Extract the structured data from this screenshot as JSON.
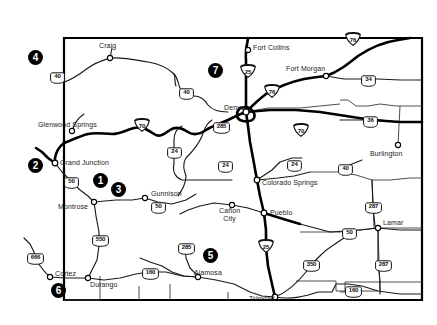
{
  "map": {
    "title": "Colorado highway map",
    "background_color": "#ffffff",
    "outline_color": "#000000",
    "state_border": {
      "corners": [
        [
          64,
          38
        ],
        [
          422,
          38
        ],
        [
          422,
          300
        ],
        [
          64,
          300
        ]
      ]
    }
  },
  "cities": [
    {
      "name": "Craig",
      "x": 108,
      "y": 47,
      "dot_x": 110,
      "dot_y": 58,
      "anchor": "center"
    },
    {
      "name": "Fort Collins",
      "x": 255,
      "y": 44,
      "dot_x": 248,
      "dot_y": 50,
      "anchor": "left"
    },
    {
      "name": "Fort Morgan",
      "x": 287,
      "y": 67,
      "dot_x": 326,
      "dot_y": 76,
      "anchor": "left"
    },
    {
      "name": "Denver",
      "x": 228,
      "y": 105,
      "dot_x": 246,
      "dot_y": 112,
      "anchor": "left"
    },
    {
      "name": "Glenwood Springs",
      "x": 39,
      "y": 122,
      "dot_x": 72,
      "dot_y": 131,
      "anchor": "left"
    },
    {
      "name": "Grand Junction",
      "x": 59,
      "y": 164,
      "dot_x": 55,
      "dot_y": 163,
      "anchor": "left"
    },
    {
      "name": "Burlington",
      "x": 371,
      "y": 152,
      "dot_x": 398,
      "dot_y": 145,
      "anchor": "left"
    },
    {
      "name": "Gunnison",
      "x": 133,
      "y": 190,
      "dot_x": 145,
      "dot_y": 198,
      "anchor": "left"
    },
    {
      "name": "Montrose",
      "x": 58,
      "y": 205,
      "dot_x": 94,
      "dot_y": 202,
      "anchor": "left"
    },
    {
      "name": "Colorado Springs",
      "x": 261,
      "y": 181,
      "dot_x": 257,
      "dot_y": 180,
      "anchor": "left"
    },
    {
      "name": "Pueblo",
      "x": 270,
      "y": 214,
      "dot_x": 264,
      "dot_y": 213,
      "anchor": "left"
    },
    {
      "name": "Lamar",
      "x": 383,
      "y": 221,
      "dot_x": 378,
      "dot_y": 228,
      "anchor": "left"
    },
    {
      "name": "Cortez",
      "x": 46,
      "y": 270,
      "dot_x": 50,
      "dot_y": 277,
      "anchor": "left"
    },
    {
      "name": "Durango",
      "x": 90,
      "y": 283,
      "dot_x": 88,
      "dot_y": 278,
      "anchor": "left"
    },
    {
      "name": "Alamosa",
      "x": 201,
      "y": 272,
      "dot_x": 198,
      "dot_y": 277,
      "anchor": "left"
    },
    {
      "name": "Trinidad",
      "x": 250,
      "y": 299,
      "dot_x": 275,
      "dot_y": 297,
      "anchor": "left"
    }
  ],
  "cities_multiline": [
    {
      "name_line1": "Cañon",
      "name_line2": "City",
      "x": 230,
      "y": 208,
      "dot_x": 232,
      "dot_y": 205
    }
  ],
  "shields": [
    {
      "route": "40",
      "type": "us",
      "x": 49,
      "y": 70
    },
    {
      "route": "40",
      "type": "us",
      "x": 178,
      "y": 86
    },
    {
      "route": "70",
      "type": "interstate",
      "x": 134,
      "y": 118
    },
    {
      "route": "285",
      "type": "us",
      "x": 212,
      "y": 120
    },
    {
      "route": "25",
      "type": "interstate",
      "x": 246,
      "y": 70
    },
    {
      "route": "76",
      "type": "interstate",
      "x": 268,
      "y": 90
    },
    {
      "route": "76",
      "type": "interstate",
      "x": 351,
      "y": 38
    },
    {
      "route": "34",
      "type": "us",
      "x": 366,
      "y": 79
    },
    {
      "route": "36",
      "type": "us",
      "x": 368,
      "y": 120
    },
    {
      "route": "70",
      "type": "interstate",
      "x": 299,
      "y": 129
    },
    {
      "route": "24",
      "type": "us",
      "x": 174,
      "y": 151
    },
    {
      "route": "24",
      "type": "us",
      "x": 225,
      "y": 165
    },
    {
      "route": "24",
      "type": "us",
      "x": 294,
      "y": 164
    },
    {
      "route": "40",
      "type": "us",
      "x": 344,
      "y": 168
    },
    {
      "route": "50",
      "type": "us",
      "x": 71,
      "y": 181
    },
    {
      "route": "50",
      "type": "us",
      "x": 158,
      "y": 206
    },
    {
      "route": "287",
      "type": "us",
      "x": 372,
      "y": 206
    },
    {
      "route": "50",
      "type": "us",
      "x": 349,
      "y": 232
    },
    {
      "route": "25",
      "type": "interstate",
      "x": 264,
      "y": 245
    },
    {
      "route": "550",
      "type": "us",
      "x": 99,
      "y": 239
    },
    {
      "route": "285",
      "type": "us",
      "x": 185,
      "y": 247
    },
    {
      "route": "350",
      "type": "us",
      "x": 310,
      "y": 264
    },
    {
      "route": "287",
      "type": "us",
      "x": 382,
      "y": 264
    },
    {
      "route": "666",
      "type": "us",
      "x": 34,
      "y": 257
    },
    {
      "route": "160",
      "type": "us",
      "x": 149,
      "y": 272
    },
    {
      "route": "160",
      "type": "us",
      "x": 352,
      "y": 290
    }
  ],
  "markers": [
    {
      "label": "1",
      "x": 100,
      "y": 180
    },
    {
      "label": "2",
      "x": 35,
      "y": 165
    },
    {
      "label": "3",
      "x": 118,
      "y": 189
    },
    {
      "label": "4",
      "x": 35,
      "y": 57
    },
    {
      "label": "5",
      "x": 210,
      "y": 255
    },
    {
      "label": "6",
      "x": 58,
      "y": 290
    },
    {
      "label": "7",
      "x": 215,
      "y": 70
    }
  ],
  "colors": {
    "marker_fill": "#000000",
    "marker_text": "#ffffff",
    "road_major": "#000000",
    "road_minor": "#333333",
    "border": "#000000",
    "label_text": "#1a1a1a"
  }
}
